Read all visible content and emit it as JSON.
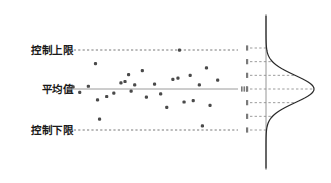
{
  "figure": {
    "type": "control-chart-with-distribution",
    "background": "#ffffff",
    "width": 331,
    "height": 183
  },
  "labels": {
    "ucl": "控制上限",
    "mean": "平均值",
    "lcl": "控制下限"
  },
  "colors": {
    "text": "#1a1a1a",
    "point": "#4a4a4a",
    "center_line": "#9a9a9a",
    "limit_line": "#6a6a6a",
    "curve": "#2b2b2b",
    "axis": "#8a8a8a",
    "sigma_line": "#8a8a8a"
  },
  "chart_data": {
    "type": "scatter",
    "title": "",
    "xlabel": "",
    "ylabel": "",
    "grid": false,
    "legend_position": "none",
    "reference_lines": [
      {
        "name": "控制上限",
        "y": 3,
        "style": "dashed"
      },
      {
        "name": "平均值",
        "y": 0,
        "style": "solid"
      },
      {
        "name": "控制下限",
        "y": -3,
        "style": "dashed"
      }
    ],
    "ylim": [
      -3.6,
      3.6
    ],
    "xlim": [
      0,
      33
    ],
    "ytick_values": [
      3,
      2,
      1,
      0,
      -1,
      -2,
      -3
    ],
    "points": [
      {
        "x": 1.0,
        "y": 0.15
      },
      {
        "x": 2.3,
        "y": -0.25
      },
      {
        "x": 4.0,
        "y": 0.2
      },
      {
        "x": 5.4,
        "y": 1.85
      },
      {
        "x": 5.8,
        "y": -0.8
      },
      {
        "x": 6.2,
        "y": -2.2
      },
      {
        "x": 7.6,
        "y": -0.55
      },
      {
        "x": 9.0,
        "y": -0.3
      },
      {
        "x": 10.4,
        "y": 0.45
      },
      {
        "x": 11.2,
        "y": 0.55
      },
      {
        "x": 11.9,
        "y": 1.05
      },
      {
        "x": 12.4,
        "y": -0.15
      },
      {
        "x": 13.1,
        "y": 0.3
      },
      {
        "x": 14.6,
        "y": 1.35
      },
      {
        "x": 15.4,
        "y": -0.6
      },
      {
        "x": 17.0,
        "y": 0.35
      },
      {
        "x": 18.2,
        "y": -0.35
      },
      {
        "x": 19.4,
        "y": -1.35
      },
      {
        "x": 20.6,
        "y": 0.7
      },
      {
        "x": 21.6,
        "y": 0.8
      },
      {
        "x": 21.9,
        "y": 2.85
      },
      {
        "x": 22.8,
        "y": -0.95
      },
      {
        "x": 24.0,
        "y": 1.0
      },
      {
        "x": 24.6,
        "y": -0.85
      },
      {
        "x": 25.8,
        "y": 0.3
      },
      {
        "x": 26.4,
        "y": -2.7
      },
      {
        "x": 27.2,
        "y": 1.55
      },
      {
        "x": 27.9,
        "y": -1.2
      },
      {
        "x": 29.4,
        "y": 0.65
      }
    ]
  },
  "distribution": {
    "type": "normal-curve",
    "orientation": "vertical",
    "mean": 0,
    "sigma": 1,
    "sigma_lines": [
      3,
      2,
      1,
      0,
      -1,
      -2,
      -3
    ],
    "tick_marks": [
      "",
      "",
      "",
      "",
      "",
      "",
      ""
    ]
  }
}
